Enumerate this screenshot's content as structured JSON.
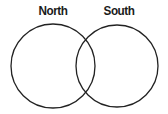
{
  "diagram": {
    "type": "venn",
    "sets": [
      {
        "label": "North",
        "cx": 53,
        "cy": 66,
        "r": 42
      },
      {
        "label": "South",
        "cx": 117,
        "cy": 66,
        "r": 41
      }
    ],
    "stroke_color": "#222222",
    "fill_color": "#ffffff"
  }
}
